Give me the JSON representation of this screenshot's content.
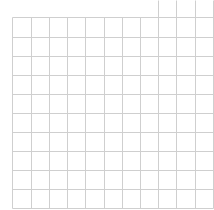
{
  "grid": {
    "width": 214,
    "height": 210,
    "background": "#ffffff",
    "line_color": "#cfcfcf",
    "line_width": 1,
    "vertical_lines_x": [
      12,
      31,
      49,
      67,
      85,
      104,
      122,
      140,
      158,
      176,
      195,
      213
    ],
    "horizontal_lines_y": [
      17,
      37,
      56,
      75,
      94,
      113,
      132,
      151,
      170,
      189,
      208
    ],
    "top": 17,
    "bottom": 208,
    "extended_top_lines_x": [
      158,
      176,
      195,
      213
    ],
    "extended_top_y": 0,
    "columns": 11,
    "rows": 10
  }
}
